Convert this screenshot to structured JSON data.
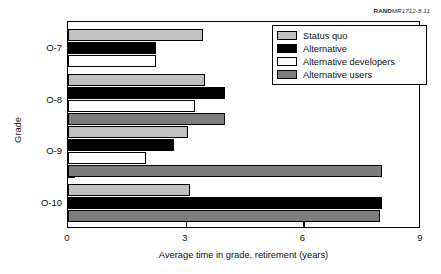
{
  "credit": {
    "publisher": "RAND",
    "document_id": "MR1712-5.11"
  },
  "chart_data": {
    "type": "bar",
    "orientation": "horizontal",
    "title": "",
    "xlabel": "Average time in grade, retirement (years)",
    "ylabel": "Grade",
    "categories": [
      "O-7",
      "O-8",
      "O-9",
      "O-10"
    ],
    "xlim": [
      0,
      9
    ],
    "xticks": [
      0,
      3,
      6,
      9
    ],
    "xtick_labels": [
      "0",
      "3",
      "6",
      "9"
    ],
    "grid": false,
    "legend_position": "top-right",
    "series": [
      {
        "name": "Status quo",
        "color": "#c0c0c0",
        "values": [
          3.45,
          3.5,
          3.05,
          3.1
        ]
      },
      {
        "name": "Alternative",
        "color": "#000000",
        "values": [
          2.25,
          4.0,
          2.7,
          8.0
        ]
      },
      {
        "name": "Alternative developers",
        "color": "#ffffff",
        "values": [
          2.25,
          3.25,
          2.0,
          0
        ]
      },
      {
        "name": "Alternative users",
        "color": "#7d7d7d",
        "values": [
          0,
          4.0,
          8.0,
          7.95
        ]
      }
    ]
  }
}
